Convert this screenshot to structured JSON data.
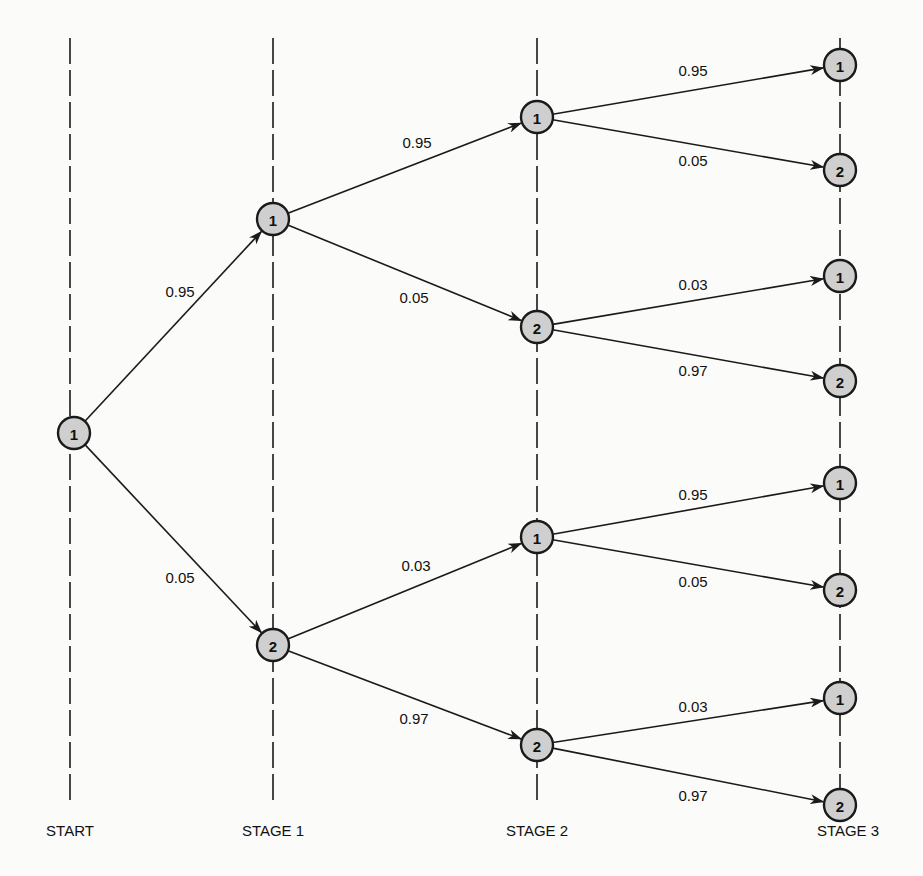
{
  "diagram": {
    "type": "probability tree",
    "stages": [
      {
        "id": "start",
        "label": "START",
        "x": 70,
        "label_x": 70
      },
      {
        "id": "stage1",
        "label": "STAGE 1",
        "x": 273,
        "label_x": 273
      },
      {
        "id": "stage2",
        "label": "STAGE 2",
        "x": 537,
        "label_x": 537
      },
      {
        "id": "stage3",
        "label": "STAGE 3",
        "x": 840,
        "label_x": 848
      }
    ],
    "nodes": [
      {
        "id": "n0",
        "label": "1",
        "stage": "start",
        "x": 74,
        "y": 433
      },
      {
        "id": "n1a",
        "label": "1",
        "stage": "stage1",
        "x": 273,
        "y": 219
      },
      {
        "id": "n1b",
        "label": "2",
        "stage": "stage1",
        "x": 273,
        "y": 645
      },
      {
        "id": "n2a",
        "label": "1",
        "stage": "stage2",
        "x": 537,
        "y": 117
      },
      {
        "id": "n2b",
        "label": "2",
        "stage": "stage2",
        "x": 537,
        "y": 327
      },
      {
        "id": "n2c",
        "label": "1",
        "stage": "stage2",
        "x": 537,
        "y": 537
      },
      {
        "id": "n2d",
        "label": "2",
        "stage": "stage2",
        "x": 537,
        "y": 745
      },
      {
        "id": "n3a",
        "label": "1",
        "stage": "stage3",
        "x": 840,
        "y": 65
      },
      {
        "id": "n3b",
        "label": "2",
        "stage": "stage3",
        "x": 840,
        "y": 170
      },
      {
        "id": "n3c",
        "label": "1",
        "stage": "stage3",
        "x": 840,
        "y": 276
      },
      {
        "id": "n3d",
        "label": "2",
        "stage": "stage3",
        "x": 840,
        "y": 381
      },
      {
        "id": "n3e",
        "label": "1",
        "stage": "stage3",
        "x": 840,
        "y": 483
      },
      {
        "id": "n3f",
        "label": "2",
        "stage": "stage3",
        "x": 840,
        "y": 590
      },
      {
        "id": "n3g",
        "label": "1",
        "stage": "stage3",
        "x": 840,
        "y": 698
      },
      {
        "id": "n3h",
        "label": "2",
        "stage": "stage3",
        "x": 840,
        "y": 805
      }
    ],
    "edges": [
      {
        "from": "n0",
        "to": "n1a",
        "prob": "0.95",
        "label_x": 180,
        "label_y": 297
      },
      {
        "from": "n0",
        "to": "n1b",
        "prob": "0.05",
        "label_x": 180,
        "label_y": 583
      },
      {
        "from": "n1a",
        "to": "n2a",
        "prob": "0.95",
        "label_x": 417,
        "label_y": 148
      },
      {
        "from": "n1a",
        "to": "n2b",
        "prob": "0.05",
        "label_x": 414,
        "label_y": 303
      },
      {
        "from": "n1b",
        "to": "n2c",
        "prob": "0.03",
        "label_x": 416,
        "label_y": 571
      },
      {
        "from": "n1b",
        "to": "n2d",
        "prob": "0.97",
        "label_x": 414,
        "label_y": 724
      },
      {
        "from": "n2a",
        "to": "n3a",
        "prob": "0.95",
        "label_x": 693,
        "label_y": 76
      },
      {
        "from": "n2a",
        "to": "n3b",
        "prob": "0.05",
        "label_x": 693,
        "label_y": 166
      },
      {
        "from": "n2b",
        "to": "n3c",
        "prob": "0.03",
        "label_x": 693,
        "label_y": 290
      },
      {
        "from": "n2b",
        "to": "n3d",
        "prob": "0.97",
        "label_x": 693,
        "label_y": 376
      },
      {
        "from": "n2c",
        "to": "n3e",
        "prob": "0.95",
        "label_x": 693,
        "label_y": 500
      },
      {
        "from": "n2c",
        "to": "n3f",
        "prob": "0.05",
        "label_x": 693,
        "label_y": 587
      },
      {
        "from": "n2d",
        "to": "n3g",
        "prob": "0.03",
        "label_x": 693,
        "label_y": 712
      },
      {
        "from": "n2d",
        "to": "n3h",
        "prob": "0.97",
        "label_x": 693,
        "label_y": 801
      }
    ],
    "stage_label_y": 836,
    "node_radius": 16,
    "colors": {
      "ink": "#1a1a1a",
      "node_fill": "#cfcfcf",
      "background": "#fbfbf9"
    }
  }
}
